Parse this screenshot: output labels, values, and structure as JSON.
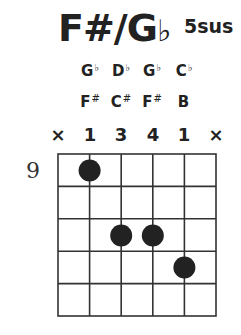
{
  "chord": {
    "root": "F#/G",
    "flat": "b",
    "quality": "5sus"
  },
  "note_rows": [
    {
      "name": "flat-names",
      "notes": [
        {
          "letter": "G",
          "acc": "b"
        },
        {
          "letter": "D",
          "acc": "b"
        },
        {
          "letter": "G",
          "acc": "b"
        },
        {
          "letter": "C",
          "acc": "b"
        }
      ]
    },
    {
      "name": "sharp-names",
      "notes": [
        {
          "letter": "F",
          "acc": "#"
        },
        {
          "letter": "C",
          "acc": "#"
        },
        {
          "letter": "F",
          "acc": "#"
        },
        {
          "letter": "B",
          "acc": ""
        }
      ]
    }
  ],
  "fingers": [
    "×",
    "1",
    "3",
    "4",
    "1",
    "×"
  ],
  "start_fret": "9",
  "grid": {
    "strings": 6,
    "frets": 5,
    "left": 58,
    "top": 154,
    "width": 158,
    "height": 162,
    "line_color": "#333333"
  },
  "dots": [
    {
      "string": 2,
      "fret": 1
    },
    {
      "string": 3,
      "fret": 3
    },
    {
      "string": 4,
      "fret": 3
    },
    {
      "string": 5,
      "fret": 4
    }
  ],
  "dot_color": "#222222"
}
